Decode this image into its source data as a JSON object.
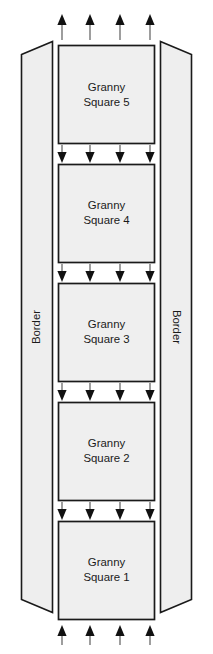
{
  "diagram": {
    "background_color": "#ffffff",
    "panel_fill_color": "#eeeeee",
    "square_fill_color": "#efefef",
    "stroke_color": "#1a1a1a",
    "arrow_color": "#111111",
    "borders": [
      {
        "id": "left-border",
        "label": "Border",
        "orientation": "vertical-up"
      },
      {
        "id": "right-border",
        "label": "Border",
        "orientation": "vertical-down"
      }
    ],
    "squares": [
      {
        "id": "granny-square-5",
        "line1": "Granny",
        "line2": "Square 5",
        "number": "5"
      },
      {
        "id": "granny-square-4",
        "line1": "Granny",
        "line2": "Square 4",
        "number": "4"
      },
      {
        "id": "granny-square-3",
        "line1": "Granny",
        "line2": "Square 3",
        "number": "3"
      },
      {
        "id": "granny-square-2",
        "line1": "Granny",
        "line2": "Square 2",
        "number": "2"
      },
      {
        "id": "granny-square-1",
        "line1": "Granny",
        "line2": "Square 1",
        "number": "1"
      }
    ],
    "arrow_rows": [
      {
        "id": "arrow-row-top",
        "direction": "up",
        "count": 4
      },
      {
        "id": "arrow-row-5-4",
        "direction": "down",
        "count": 4
      },
      {
        "id": "arrow-row-4-3",
        "direction": "down",
        "count": 4
      },
      {
        "id": "arrow-row-3-2",
        "direction": "down",
        "count": 4
      },
      {
        "id": "arrow-row-2-1",
        "direction": "down",
        "count": 4
      },
      {
        "id": "arrow-row-bottom",
        "direction": "up",
        "count": 4
      }
    ]
  }
}
